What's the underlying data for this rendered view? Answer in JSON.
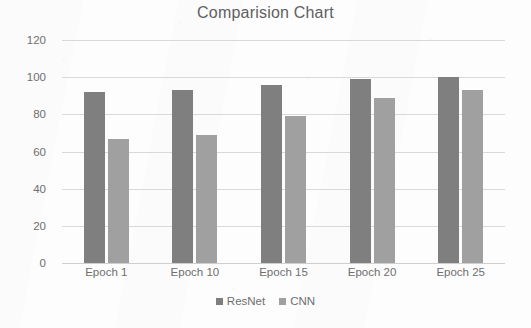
{
  "chart_data": {
    "type": "bar",
    "title": "Comparision Chart",
    "xlabel": "",
    "ylabel": "",
    "categories": [
      "Epoch 1",
      "Epoch 10",
      "Epoch 15",
      "Epoch 20",
      "Epoch 25"
    ],
    "series": [
      {
        "name": "ResNet",
        "color": "#7f7f7f",
        "values": [
          92,
          93,
          96,
          99,
          100
        ]
      },
      {
        "name": "CNN",
        "color": "#a0a0a0",
        "values": [
          67,
          69,
          79,
          89,
          93
        ]
      }
    ],
    "ylim": [
      0,
      120
    ],
    "yticks": [
      0,
      20,
      40,
      60,
      80,
      100,
      120
    ],
    "ytick_labels": [
      "0",
      "20",
      "40",
      "60",
      "80",
      "100",
      "120"
    ],
    "grid": true,
    "legend_position": "bottom"
  }
}
